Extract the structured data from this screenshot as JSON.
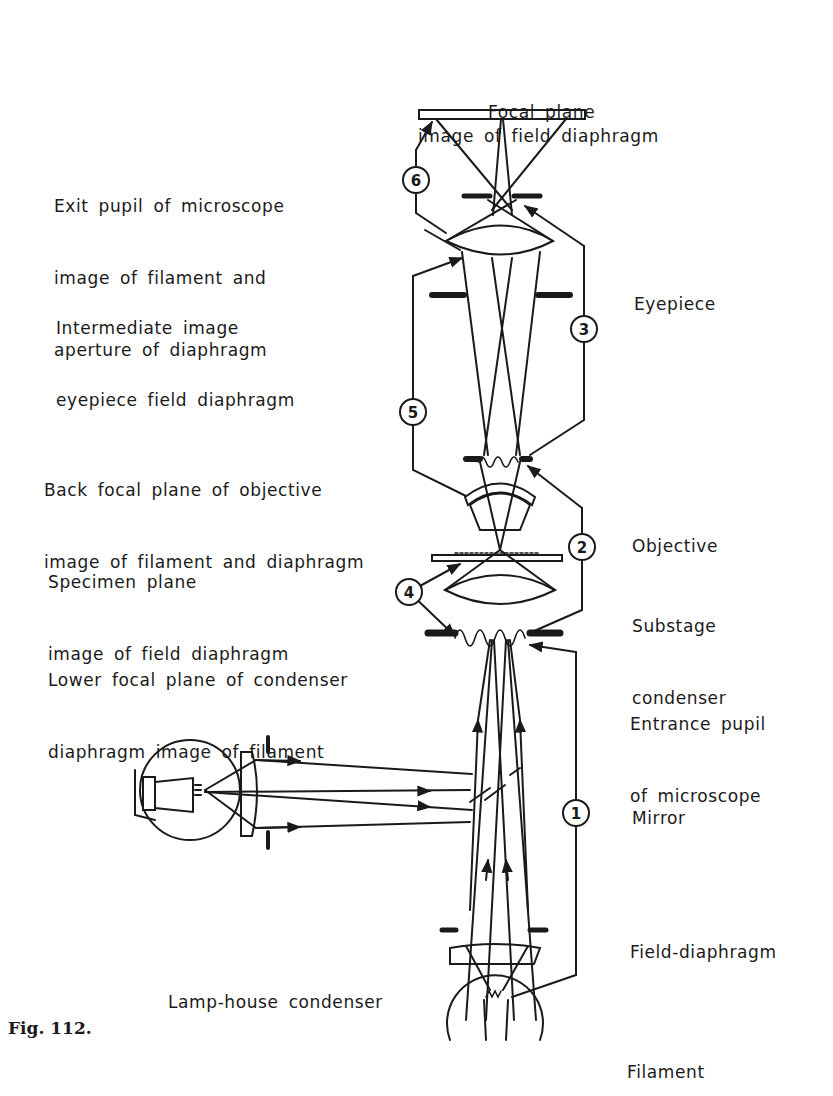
{
  "figure": {
    "caption": "Fig. 112.",
    "title_line1": "Focal plane",
    "title_line2": "image of field diaphragm"
  },
  "left_labels": [
    {
      "line1": "Exit pupil of microscope",
      "line2": "image of filament and",
      "line3": "aperture of diaphragm"
    },
    {
      "line1": "Intermediate image",
      "line2": "eyepiece field diaphragm"
    },
    {
      "line1": "Back focal plane of objective",
      "line2": "image of filament and diaphragm"
    },
    {
      "line1": "Specimen plane",
      "line2": "image of field diaphragm"
    },
    {
      "line1": "Lower focal plane of condenser",
      "line2": "diaphragm image of filament"
    },
    {
      "line1": "Lamp-house condenser"
    }
  ],
  "right_labels": [
    {
      "line1": "Eyepiece"
    },
    {
      "line1": "Objective"
    },
    {
      "line1": "Substage",
      "line2": "condenser"
    },
    {
      "line1": "Entrance pupil",
      "line2": "of microscope"
    },
    {
      "line1": "Mirror"
    },
    {
      "line1": "Field-diaphragm"
    },
    {
      "line1": "Filament"
    }
  ],
  "markers": [
    "1",
    "2",
    "3",
    "4",
    "5",
    "6"
  ],
  "colors": {
    "ink": "#1a1a1a",
    "background": "#ffffff"
  }
}
